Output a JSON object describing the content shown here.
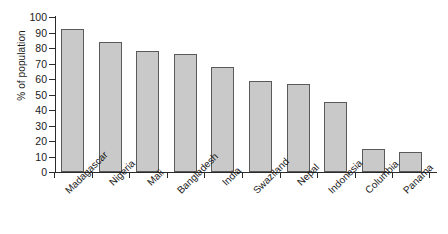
{
  "chart_data": {
    "type": "bar",
    "title": "",
    "subtitle": "",
    "xlabel": "",
    "ylabel": "% of population",
    "ylim": [
      0,
      100
    ],
    "ytick_values": [
      0,
      10,
      20,
      30,
      40,
      50,
      60,
      70,
      80,
      90,
      100
    ],
    "ytick_labels": [
      "0",
      "10",
      "20",
      "30",
      "40",
      "50",
      "60",
      "70",
      "80",
      "90",
      "100"
    ],
    "grid": false,
    "legend": null,
    "bar_color": "#c9c9c9",
    "bar_edge_color": "#5a5a5a",
    "axis_color": "#2b2b2b",
    "categories": [
      "Madagascar",
      "Nigeria",
      "Mali",
      "Bangladesh",
      "India",
      "Swaziland",
      "Nepal",
      "Indonesia",
      "Columbia",
      "Panama"
    ],
    "values": [
      92,
      84,
      78,
      76,
      68,
      59,
      57,
      45,
      15,
      13
    ],
    "label_rotation_deg": -45,
    "label_stagger": [
      "low",
      "high",
      "high",
      "low",
      "high",
      "low",
      "high",
      "low",
      "low",
      "low"
    ]
  }
}
